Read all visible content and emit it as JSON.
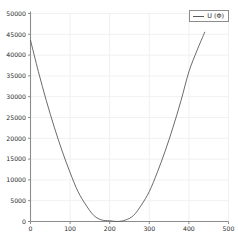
{
  "legend": {
    "position": "top-right",
    "entries": [
      {
        "label": "U (Φ)",
        "color": "#5a5a5a"
      }
    ]
  },
  "axes": {
    "y_ticks": [
      "0",
      "5000",
      "10000",
      "15000",
      "20000",
      "25000",
      "30000",
      "35000",
      "40000",
      "45000",
      "50000"
    ],
    "x_ticks": [
      "0",
      "100",
      "200",
      "300",
      "400",
      "500"
    ]
  },
  "style": {
    "line_color": "#5a5a5a",
    "axis_color": "#8c8c8c",
    "grid_color": "#f2f0f0",
    "background": "#ffffff",
    "tick_text_color": "#2b2b2b"
  },
  "chart_data": {
    "type": "line",
    "title": "",
    "xlabel": "",
    "ylabel": "",
    "xlim": [
      0,
      500
    ],
    "ylim": [
      0,
      50000
    ],
    "xticks": [
      0,
      100,
      200,
      300,
      400,
      500
    ],
    "yticks": [
      0,
      5000,
      10000,
      15000,
      20000,
      25000,
      30000,
      35000,
      40000,
      45000,
      50000
    ],
    "grid": true,
    "legend_position": "upper right",
    "series": [
      {
        "name": "U (Φ)",
        "color": "#5a5a5a",
        "x": [
          0,
          20,
          40,
          60,
          80,
          100,
          120,
          140,
          160,
          180,
          200,
          220,
          240,
          260,
          280,
          300,
          320,
          340,
          360,
          380,
          400,
          420,
          440
        ],
        "y": [
          43560,
          36000,
          29040,
          22680,
          16920,
          11760,
          7200,
          3960,
          1440,
          360,
          180,
          0,
          360,
          1440,
          3960,
          7200,
          11760,
          16920,
          22680,
          29040,
          36000,
          41000,
          45500
        ]
      }
    ]
  }
}
